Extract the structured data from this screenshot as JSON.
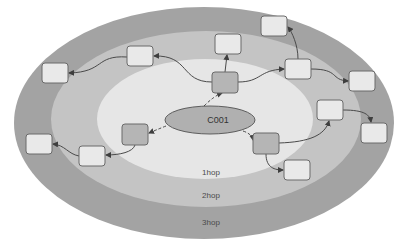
{
  "diagram": {
    "type": "concentric-hop-diagram",
    "center_node": {
      "label": "C001"
    },
    "layers": [
      {
        "id": "hop1",
        "label": "1hop",
        "color": "#e6e6e6"
      },
      {
        "id": "hop2",
        "label": "2hop",
        "color": "#c4c4c4"
      },
      {
        "id": "hop3",
        "label": "3hop",
        "color": "#a3a3a3"
      }
    ],
    "colors": {
      "background": "#ffffff",
      "center_fill": "#b0b0b0",
      "hop1_node_fill": "#b5b5b5",
      "outer_node_fill": "#e9e9e9",
      "node_border": "#6a6a6a",
      "edge": "#4a4a4a"
    },
    "nodes": [
      {
        "id": "A",
        "layer": "1hop",
        "label": ""
      },
      {
        "id": "B",
        "layer": "1hop",
        "label": ""
      },
      {
        "id": "C",
        "layer": "1hop",
        "label": ""
      },
      {
        "id": "D",
        "layer": "2hop",
        "label": ""
      },
      {
        "id": "F",
        "layer": "2hop",
        "label": ""
      },
      {
        "id": "H",
        "layer": "2hop",
        "label": ""
      },
      {
        "id": "J",
        "layer": "2hop",
        "label": ""
      },
      {
        "id": "L",
        "layer": "2hop",
        "label": ""
      },
      {
        "id": "M",
        "layer": "2hop",
        "label": ""
      },
      {
        "id": "E",
        "layer": "3hop",
        "label": ""
      },
      {
        "id": "G",
        "layer": "3hop",
        "label": ""
      },
      {
        "id": "I",
        "layer": "3hop",
        "label": ""
      },
      {
        "id": "K",
        "layer": "3hop",
        "label": ""
      },
      {
        "id": "N",
        "layer": "3hop",
        "label": ""
      }
    ],
    "edges": [
      {
        "from": "C001",
        "to": "A",
        "style": "dashed"
      },
      {
        "from": "C001",
        "to": "B",
        "style": "dashed"
      },
      {
        "from": "C001",
        "to": "C",
        "style": "dashed"
      },
      {
        "from": "A",
        "to": "D",
        "style": "solid"
      },
      {
        "from": "A",
        "to": "F",
        "style": "solid"
      },
      {
        "from": "A",
        "to": "H",
        "style": "solid"
      },
      {
        "from": "D",
        "to": "E",
        "style": "solid"
      },
      {
        "from": "H",
        "to": "G",
        "style": "solid"
      },
      {
        "from": "H",
        "to": "I",
        "style": "solid"
      },
      {
        "from": "C",
        "to": "J",
        "style": "solid"
      },
      {
        "from": "C",
        "to": "L",
        "style": "solid"
      },
      {
        "from": "J",
        "to": "K",
        "style": "solid"
      },
      {
        "from": "B",
        "to": "M",
        "style": "solid"
      },
      {
        "from": "M",
        "to": "N",
        "style": "solid"
      }
    ]
  }
}
